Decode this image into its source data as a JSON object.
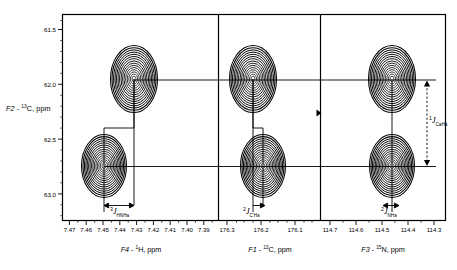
{
  "figure": {
    "type": "nmr-2d-contour-cross-sections",
    "panel_count": 3,
    "background": "#ffffff",
    "line_color": "#000000"
  },
  "yaxis": {
    "label_prefix": "F2",
    "label_dash": " - ",
    "label_sup": "13",
    "label_nucleus": "C, ppm",
    "label_full": "F2 - 13C, ppm",
    "ticks": [
      "61.5",
      "62.0",
      "62.5",
      "63.0"
    ],
    "range": [
      61.35,
      63.25
    ],
    "direction": "increasing-downward"
  },
  "panels": [
    {
      "id": "panel-f4",
      "label_prefix": "F4",
      "label_sup": "1",
      "label_nucleus": "H, ppm",
      "label_full": "F4 - 1H, ppm",
      "ticks": [
        "7.47",
        "7.46",
        "7.45",
        "7.44",
        "7.43",
        "7.42",
        "7.41",
        "7.40",
        "7.39"
      ],
      "range": [
        7.475,
        7.385
      ],
      "peak_x_ppm": [
        7.4305,
        7.4245
      ],
      "coupling": {
        "order": "3",
        "symbol": "J",
        "subscript": "HNHa"
      }
    },
    {
      "id": "panel-f1",
      "label_prefix": "F1",
      "label_sup": "13",
      "label_nucleus": "C, ppm",
      "label_full": "F1 - 13C, ppm",
      "ticks": [
        "176.3",
        "176.2",
        "176.1"
      ],
      "range": [
        176.345,
        176.065
      ],
      "peak_x_ppm": [
        176.232,
        176.222
      ],
      "coupling": {
        "order": "2",
        "symbol": "J",
        "subscript": "C'Ha"
      }
    },
    {
      "id": "panel-f3",
      "label_prefix": "F3",
      "label_sup": "15",
      "label_nucleus": "N, ppm",
      "label_full": "F3 - 15N, ppm",
      "ticks": [
        "114.7",
        "114.6",
        "114.5",
        "114.4",
        "114.3"
      ],
      "range": [
        114.745,
        114.275
      ],
      "peak_x_ppm": [
        114.485,
        114.475
      ],
      "coupling": {
        "order": "2",
        "symbol": "J",
        "subscript": "NHa"
      }
    }
  ],
  "peaks": {
    "rows_y_ppm": [
      62.105,
      62.895
    ],
    "contour_rings": 15,
    "description": "two rows of elliptical contour multiplet peaks, one pair per panel"
  },
  "vertical_annotation": {
    "order": "1",
    "symbol": "J",
    "subscript": "CaHa",
    "style": "dashed double-headed arrow",
    "spans_y_ppm": [
      62.105,
      62.895
    ]
  },
  "marker": {
    "name": "triangle-marker",
    "shape": "right-pointing-triangle",
    "y_ppm": 62.45
  }
}
